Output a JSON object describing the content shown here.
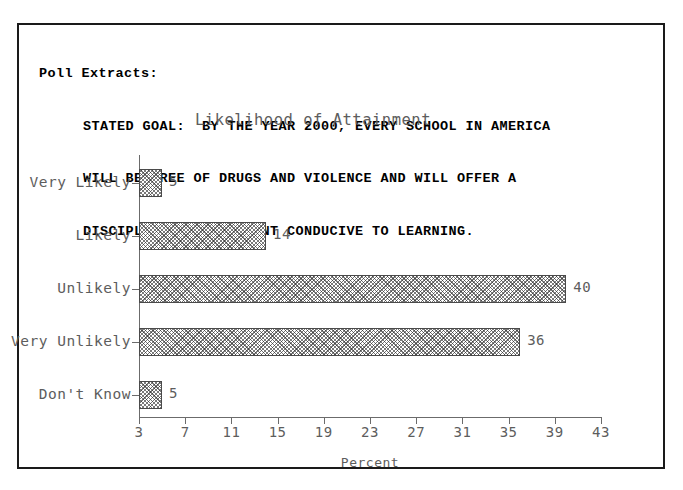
{
  "document": {
    "header_title": "Poll Extracts:",
    "stated_goal_lines": [
      "STATED GOAL:  BY THE YEAR 2000, EVERY SCHOOL IN AMERICA",
      "WILL BE FREE OF DRUGS AND VIOLENCE AND WILL OFFER A",
      "DISCIPLINED ENVIRONMENT CONDUCIVE TO LEARNING."
    ]
  },
  "colors": {
    "frame": "#1a1a1a",
    "axis": "#6b6b6b",
    "bar_outline": "#4a4a4a",
    "plot_text": "#5d5d5d",
    "header_text": "#000000",
    "background": "#ffffff"
  },
  "chart_data": {
    "type": "bar",
    "orientation": "horizontal",
    "title": "Likelihood of Attainment",
    "xlabel": "Percent",
    "ylabel": "",
    "categories": [
      "Very Likely",
      "Likely",
      "Unlikely",
      "Very Unlikely",
      "Don't Know"
    ],
    "values": [
      5,
      14,
      40,
      36,
      5
    ],
    "value_labels": [
      "5",
      "14",
      "40",
      "36",
      "5"
    ],
    "xlim": [
      3,
      43
    ],
    "xticks": [
      3,
      7,
      11,
      15,
      19,
      23,
      27,
      31,
      35,
      39,
      43
    ],
    "xtick_labels": [
      "3",
      "7",
      "11",
      "15",
      "19",
      "23",
      "27",
      "31",
      "35",
      "39",
      "43"
    ],
    "baseline": 3,
    "grid": false,
    "legend": false,
    "bar_fill": "cross-hatch"
  }
}
